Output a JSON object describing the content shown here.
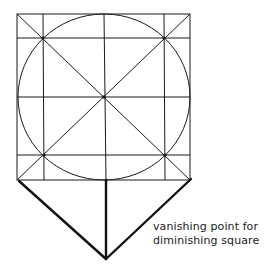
{
  "diagram": {
    "caption_lines": [
      "vanishing point for",
      "diminishing square"
    ],
    "colors": {
      "stroke": "#1a1a1a",
      "background": "#ffffff"
    },
    "square": {
      "x1": 17,
      "y1": 14,
      "x2": 190,
      "y2": 180
    },
    "center": {
      "x": 104,
      "y": 96
    },
    "circle": {
      "rx": 86,
      "ry": 83
    },
    "inner_verticals_x": [
      43,
      164
    ],
    "inner_horizontals_y": [
      38,
      155
    ],
    "vanishing_point": {
      "x": 106,
      "y": 259
    }
  }
}
